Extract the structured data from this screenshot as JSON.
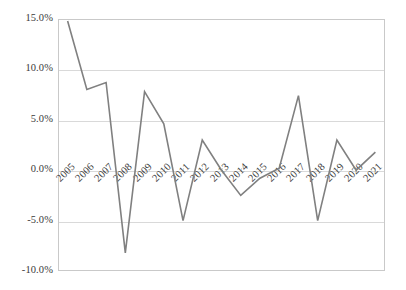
{
  "chart_data": {
    "type": "line",
    "title": "",
    "xlabel": "",
    "ylabel": "",
    "categories": [
      "2005",
      "2006",
      "2007",
      "2008",
      "2009",
      "2010",
      "2011",
      "2012",
      "2013",
      "2014",
      "2015",
      "2016",
      "2017",
      "2018",
      "2019",
      "2020",
      "2021"
    ],
    "values": [
      14.8,
      8.0,
      8.7,
      -8.2,
      7.8,
      4.6,
      -5.0,
      3.0,
      0.0,
      -2.5,
      -0.8,
      0.2,
      7.4,
      -5.0,
      3.0,
      0.0,
      1.8
    ],
    "series": [
      {
        "name": "",
        "values": [
          14.8,
          8.0,
          8.7,
          -8.2,
          7.8,
          4.6,
          -5.0,
          3.0,
          0.0,
          -2.5,
          -0.8,
          0.2,
          7.4,
          -5.0,
          3.0,
          0.0,
          1.8
        ]
      }
    ],
    "ylim": [
      -10,
      15
    ],
    "ytick_labels": [
      "15.0%",
      "10.0%",
      "5.0%",
      "0.0%",
      "-5.0%",
      "-10.0%"
    ],
    "ytick_values": [
      15,
      10,
      5,
      0,
      -5,
      -10
    ],
    "grid": true,
    "legend": "none",
    "line_color": "#808080",
    "grid_color": "#d9d9d9",
    "axis_color": "#c9c9c9",
    "text_color": "#3a3a3a",
    "background_color": "#ffffff",
    "unit": "%"
  }
}
